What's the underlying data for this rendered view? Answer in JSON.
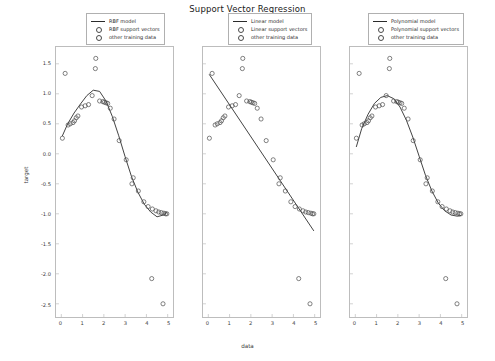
{
  "figure": {
    "title": "Support Vector Regression",
    "xlabel": "data",
    "ylabel": "target"
  },
  "axes": {
    "xticks": [
      "0",
      "1",
      "2",
      "3",
      "4",
      "5"
    ],
    "xtick_values": [
      0,
      1,
      2,
      3,
      4,
      5
    ],
    "yticks": [
      "1.5",
      "1.0",
      "0.5",
      "0.0",
      "-0.5",
      "-1.0",
      "-1.5",
      "-2.0",
      "-2.5"
    ],
    "ytick_values": [
      1.5,
      1.0,
      0.5,
      0.0,
      -0.5,
      -1.0,
      -1.5,
      -2.0,
      -2.5
    ],
    "xlim": [
      -0.25,
      5.25
    ],
    "ylim": [
      -2.72,
      1.78
    ],
    "grid": false
  },
  "colors": {
    "model_line": "#2b2b2b",
    "marker_edge": "#4a4a4a",
    "axis": "#bdbdbd",
    "text": "#2b2b2b"
  },
  "panels": [
    {
      "id": "rbf",
      "legend_position": "upper center",
      "legend": [
        {
          "label": "RBF model",
          "marker": "line"
        },
        {
          "label": "RBF support vectors",
          "marker": "circle"
        },
        {
          "label": "other training data",
          "marker": "circle"
        }
      ]
    },
    {
      "id": "linear",
      "legend_position": "upper center",
      "legend": [
        {
          "label": "Linear model",
          "marker": "line"
        },
        {
          "label": "Linear support vectors",
          "marker": "circle"
        },
        {
          "label": "other training data",
          "marker": "circle"
        }
      ]
    },
    {
      "id": "polynomial",
      "legend_position": "upper center",
      "legend": [
        {
          "label": "Polynomial model",
          "marker": "line"
        },
        {
          "label": "Polynomial support vectors",
          "marker": "circle"
        },
        {
          "label": "other training data",
          "marker": "circle"
        }
      ]
    }
  ],
  "chart_data": {
    "type": "scatter",
    "title": "Support Vector Regression",
    "xlabel": "data",
    "ylabel": "target",
    "xlim": [
      -0.25,
      5.25
    ],
    "ylim": [
      -2.72,
      1.78
    ],
    "grid": false,
    "training_points": {
      "x": [
        0.05,
        0.18,
        0.32,
        0.55,
        0.62,
        0.7,
        0.78,
        0.95,
        1.12,
        1.28,
        1.45,
        1.62,
        1.8,
        1.95,
        2.02,
        2.1,
        2.18,
        2.3,
        2.48,
        2.72,
        3.05,
        3.38,
        3.62,
        3.88,
        4.08,
        4.28,
        4.45,
        4.58,
        4.7,
        4.82,
        4.9,
        4.96,
        0.42,
        1.6,
        3.32,
        4.25,
        4.78
      ],
      "y": [
        0.26,
        1.34,
        0.48,
        0.52,
        0.55,
        0.6,
        0.63,
        0.78,
        0.8,
        0.82,
        0.97,
        1.59,
        0.88,
        0.87,
        0.86,
        0.85,
        0.84,
        0.76,
        0.58,
        0.22,
        -0.1,
        -0.4,
        -0.62,
        -0.8,
        -0.88,
        -0.92,
        -0.95,
        -0.97,
        -0.98,
        -0.99,
        -1.0,
        -1.0,
        0.5,
        1.42,
        -0.5,
        -2.08,
        -2.5
      ],
      "note": "sine-like target with several outliers"
    },
    "series": [
      {
        "name": "RBF model",
        "kernel": "rbf",
        "panel": "rbf",
        "type": "line",
        "curve_x": [
          0.05,
          0.3,
          0.6,
          0.9,
          1.2,
          1.5,
          1.8,
          2.1,
          2.4,
          2.7,
          3.0,
          3.3,
          3.6,
          3.9,
          4.2,
          4.5,
          4.8,
          4.95
        ],
        "curve_y": [
          0.3,
          0.5,
          0.68,
          0.83,
          0.97,
          1.06,
          1.04,
          0.88,
          0.62,
          0.3,
          -0.05,
          -0.38,
          -0.64,
          -0.84,
          -0.97,
          -1.05,
          -1.02,
          -0.98
        ]
      },
      {
        "name": "Linear model",
        "kernel": "linear",
        "panel": "linear",
        "type": "line",
        "curve_x": [
          0.05,
          4.95
        ],
        "curve_y": [
          1.32,
          -1.28
        ]
      },
      {
        "name": "Polynomial model",
        "kernel": "poly",
        "panel": "polynomial",
        "type": "line",
        "curve_x": [
          0.05,
          0.3,
          0.6,
          0.9,
          1.2,
          1.5,
          1.8,
          2.1,
          2.4,
          2.7,
          3.0,
          3.3,
          3.6,
          3.9,
          4.2,
          4.5,
          4.8,
          4.95
        ],
        "curve_y": [
          0.12,
          0.42,
          0.66,
          0.84,
          0.94,
          0.97,
          0.92,
          0.78,
          0.56,
          0.28,
          -0.04,
          -0.36,
          -0.62,
          -0.82,
          -0.95,
          -1.02,
          -1.04,
          -1.03
        ]
      }
    ]
  }
}
